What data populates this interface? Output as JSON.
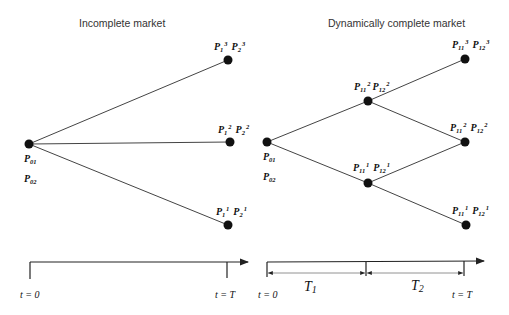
{
  "left_diagram": {
    "title": "Incomplete market",
    "root": {
      "label_a": "P",
      "label_a_sub": "01",
      "label_b": "P",
      "label_b_sub": "02"
    },
    "leaves": [
      {
        "p1": "P",
        "p1_sub": "1",
        "p1_sup": "3",
        "p2": "P",
        "p2_sub": "2",
        "p2_sup": "3"
      },
      {
        "p1": "P",
        "p1_sub": "1",
        "p1_sup": "2",
        "p2": "P",
        "p2_sub": "2",
        "p2_sup": "2"
      },
      {
        "p1": "P",
        "p1_sub": "1",
        "p1_sup": "1",
        "p2": "P",
        "p2_sub": "2",
        "p2_sup": "1"
      }
    ],
    "timeline": {
      "start": "t = 0",
      "end": "t = T"
    }
  },
  "right_diagram": {
    "title": "Dynamically complete market",
    "root": {
      "label_a": "P",
      "label_a_sub": "01",
      "label_b": "P",
      "label_b_sub": "02"
    },
    "middle": [
      {
        "p1": "P",
        "p1_sub": "11",
        "p1_sup": "2",
        "p2": "P",
        "p2_sub": "12",
        "p2_sup": "2"
      },
      {
        "p1": "P",
        "p1_sub": "11",
        "p1_sup": "1",
        "p2": "P",
        "p2_sub": "12",
        "p2_sup": "1"
      }
    ],
    "leaves": [
      {
        "p1": "P",
        "p1_sub": "11",
        "p1_sup": "3",
        "p2": "P",
        "p2_sub": "12",
        "p2_sup": "3"
      },
      {
        "p1": "P",
        "p1_sub": "11",
        "p1_sup": "2",
        "p2": "P",
        "p2_sub": "12",
        "p2_sup": "2"
      },
      {
        "p1": "P",
        "p1_sub": "11",
        "p1_sup": "1",
        "p2": "P",
        "p2_sub": "12",
        "p2_sup": "1"
      }
    ],
    "timeline": {
      "start": "t = 0",
      "end": "t = T",
      "period1": {
        "label": "T",
        "sub": "1"
      },
      "period2": {
        "label": "T",
        "sub": "2"
      }
    }
  }
}
